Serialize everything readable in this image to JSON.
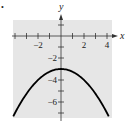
{
  "marker": "•",
  "chart_data": {
    "type": "line",
    "title": "",
    "xlabel": "x",
    "ylabel": "y",
    "xlim": [
      -4.3,
      4.4
    ],
    "ylim": [
      -7.6,
      1.5
    ],
    "grid": false,
    "background": "#e6e6e6",
    "x_ticks": [
      -4,
      -3,
      -2,
      -1,
      1,
      2,
      3,
      4
    ],
    "x_tick_labels": [
      {
        "value": -2,
        "label": "−2"
      },
      {
        "value": 2,
        "label": "2"
      },
      {
        "value": 4,
        "label": "4"
      }
    ],
    "y_ticks": [
      1,
      -1,
      -2,
      -3,
      -4,
      -5,
      -6,
      -7
    ],
    "y_tick_labels": [
      {
        "value": -2,
        "label": "−2"
      },
      {
        "value": -4,
        "label": "−4"
      },
      {
        "value": -6,
        "label": "−6"
      }
    ],
    "series": [
      {
        "name": "parabola",
        "equation": "y = -x^2/4 - 3",
        "vertex": [
          0,
          -3
        ],
        "opens": "down",
        "x": [
          -4.1,
          -3,
          -2,
          -1,
          0,
          1,
          2,
          3,
          4.1
        ],
        "y": [
          -7.2,
          -5.25,
          -4,
          -3.25,
          -3,
          -3.25,
          -4,
          -5.25,
          -7.2
        ],
        "color": "#000000"
      }
    ]
  }
}
